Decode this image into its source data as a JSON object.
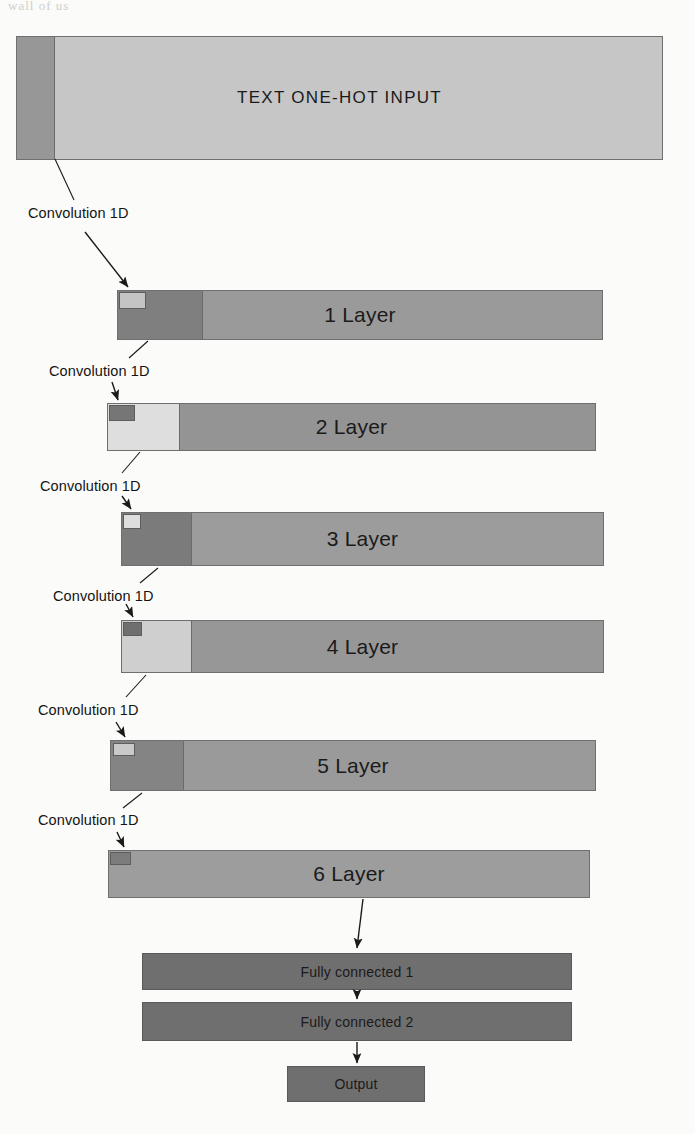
{
  "diagram": {
    "background_color": "#fbfbfa",
    "bleed_text": "wall of us",
    "colors": {
      "dark_gray": "#757575",
      "mid_gray": "#8e8e8e",
      "light_gray": "#c6c6c6",
      "very_light_gray": "#dcdcdc",
      "pale_gray": "#e2e2e2",
      "fc_gray": "#6f6f6f",
      "outline": "#6f6f6f",
      "arrow": "#1a1a1a",
      "text": "#1a1a1a"
    },
    "input": {
      "label": "TEXT ONE-HOT INPUT"
    },
    "layers": [
      {
        "label": "1 Layer"
      },
      {
        "label": "2 Layer"
      },
      {
        "label": "3 Layer"
      },
      {
        "label": "4 Layer"
      },
      {
        "label": "5 Layer"
      },
      {
        "label": "6 Layer"
      }
    ],
    "conv_labels": [
      "Convolution 1D",
      "Convolution 1D",
      "Convolution 1D",
      "Convolution 1D",
      "Convolution 1D",
      "Convolution 1D"
    ],
    "dense": [
      {
        "label": "Fully connected 1"
      },
      {
        "label": "Fully connected 2"
      }
    ],
    "output": {
      "label": "Output"
    }
  }
}
